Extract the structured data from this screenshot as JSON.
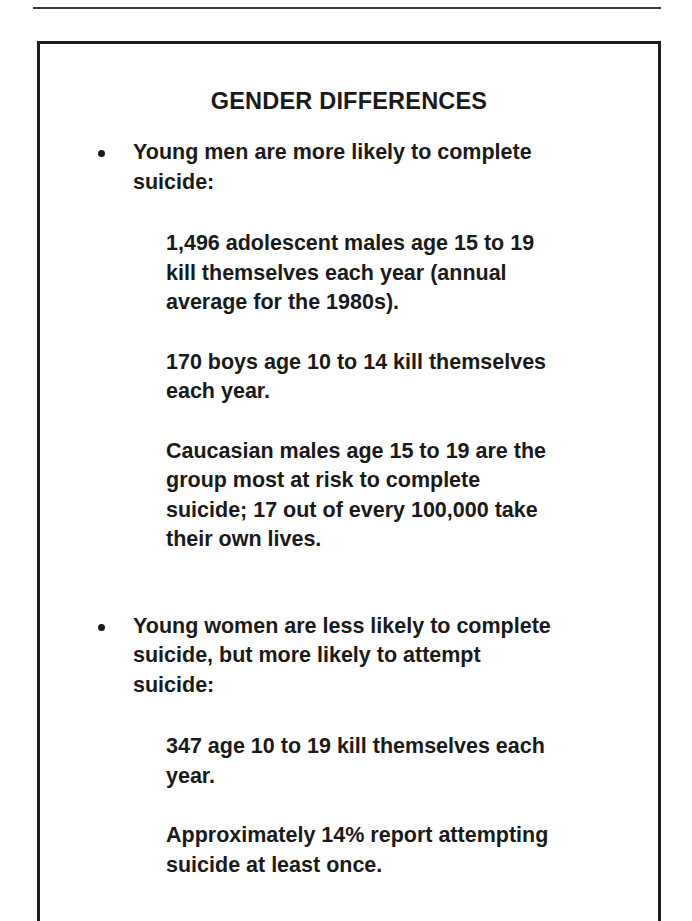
{
  "document": {
    "type": "presentation-slide",
    "title": "GENDER DIFFERENCES",
    "text_color": "#1a1a1a",
    "background_color": "#ffffff",
    "border_color": "#1c1c1c"
  },
  "slide": {
    "title": "GENDER DIFFERENCES",
    "bullets": [
      {
        "marker": "•",
        "text": "Young men are more likely to complete suicide:",
        "sub_paragraphs": [
          "1,496 adolescent males age 15 to 19 kill themselves each year (annual average for the 1980s).",
          "170 boys age 10 to 14 kill themselves each year.",
          "Caucasian males age 15 to 19 are the group most at risk to complete suicide; 17 out of every 100,000 take their own lives."
        ]
      },
      {
        "marker": "•",
        "text": "Young women are less likely to complete suicide, but more likely to attempt suicide:",
        "sub_paragraphs": [
          "347 age 10 to 19 kill themselves each year.",
          "Approximately 14% report attempting suicide at least once."
        ]
      }
    ]
  }
}
